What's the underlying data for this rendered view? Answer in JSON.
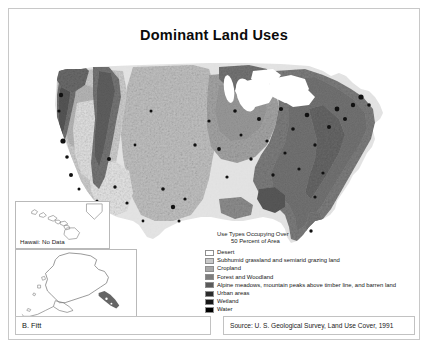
{
  "poster": {
    "title": "Dominant Land Uses",
    "byline": "B. Fitt",
    "source": "Source: U. S. Geological Survey, Land Use Cover, 1991"
  },
  "insets": {
    "hawaii": {
      "label": "Hawaii:  No Data",
      "name": "hawaii-inset"
    },
    "alaska": {
      "label": "Alaska:  No Data",
      "name": "alaska-inset"
    }
  },
  "legend": {
    "header_line1": "Use Types Occupying Over",
    "header_line2": "50 Percent of Area",
    "items": [
      {
        "label": "Desert",
        "color": "#ffffff"
      },
      {
        "label": "Subhumid grassland and semiarid grazing land",
        "color": "#c9c9c9"
      },
      {
        "label": "Cropland",
        "color": "#a8a8a8"
      },
      {
        "label": "Forest and Woodland",
        "color": "#7d7d7d"
      },
      {
        "label": "Alpine meadows, mountain peaks above timber line,  and barren land",
        "color": "#5a5a5a"
      },
      {
        "label": "Urban areas",
        "color": "#2b2b2b"
      },
      {
        "label": "Wetland",
        "color": "#161616"
      },
      {
        "label": "Water",
        "color": "#000000"
      }
    ]
  },
  "map": {
    "name": "conterminous-us-landuse-raster",
    "palette": {
      "desert": "#f2f2f2",
      "grassland": "#c9c9c9",
      "cropland": "#a8a8a8",
      "forest": "#777777",
      "alpine": "#555555",
      "urban": "#1d1d1d",
      "wetland": "#303030",
      "water": "#f4f4f4",
      "background": "#ffffff"
    }
  }
}
